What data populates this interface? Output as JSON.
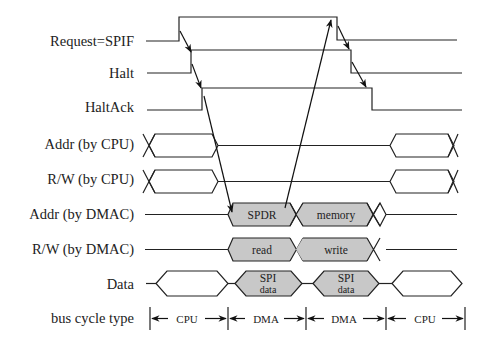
{
  "diagram": {
    "signals": [
      {
        "label": "Request=SPIF"
      },
      {
        "label": "Halt"
      },
      {
        "label": "HaltAck"
      },
      {
        "label": "Addr (by CPU)"
      },
      {
        "label": "R/W (by CPU)"
      },
      {
        "label": "Addr (by DMAC)",
        "segments": [
          "SPDR",
          "memory"
        ]
      },
      {
        "label": "R/W (by DMAC)",
        "segments": [
          "read",
          "write"
        ]
      },
      {
        "label": "Data",
        "segments": [
          [
            "SPI",
            "data"
          ],
          [
            "SPI",
            "data"
          ]
        ]
      },
      {
        "label": "bus cycle type",
        "segments": [
          "CPU",
          "DMA",
          "DMA",
          "CPU"
        ]
      }
    ],
    "colors": {
      "line": "#222222",
      "shaded": "#c8c8c8",
      "background": "#ffffff"
    }
  }
}
